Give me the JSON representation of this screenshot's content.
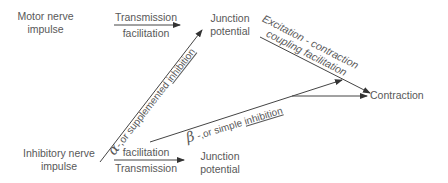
{
  "diagram": {
    "nodes": {
      "motor_nerve": {
        "line1": "Motor nerve",
        "line2": "impulse"
      },
      "junction_top": {
        "line1": "Junction",
        "line2": "potential"
      },
      "contraction": {
        "label": "Contraction"
      },
      "inhibitory_nerve": {
        "line1": "Inhibitory nerve",
        "line2": "impulse"
      },
      "junction_bottom": {
        "line1": "Junction",
        "line2": "potential"
      }
    },
    "edges": {
      "motor_to_junction": {
        "above": "Transmission",
        "below": "facilitation"
      },
      "junction_to_contraction": {
        "line1": "Excitation - contraction",
        "line2": "coupling facilitation"
      },
      "alpha": {
        "greek": "α",
        "prefix": "-,or supplemented ",
        "underlined": "inhibition"
      },
      "beta": {
        "greek": "β",
        "prefix": " -,or simple ",
        "underlined": "inhibition"
      },
      "inhibitory_to_junction": {
        "above": "facilitation",
        "below": "Transmission"
      }
    },
    "colors": {
      "line": "#333333",
      "text": "#585858"
    }
  }
}
